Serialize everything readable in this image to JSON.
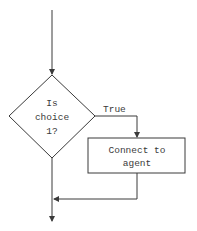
{
  "diagram": {
    "type": "flowchart",
    "decision": {
      "lines": [
        "Is",
        "choice",
        "1?"
      ]
    },
    "branch_label": "True",
    "process": {
      "lines": [
        "Connect to",
        "agent"
      ]
    },
    "colors": {
      "stroke": "#3a3a3a",
      "background": "#ffffff"
    }
  }
}
